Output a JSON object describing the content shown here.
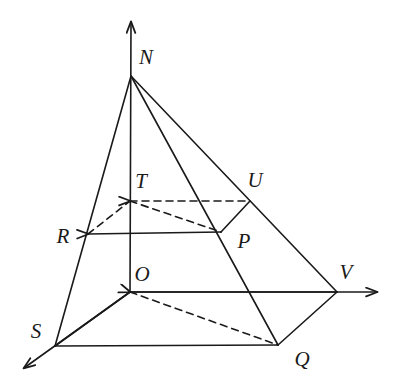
{
  "figure": {
    "type": "geometric-diagram",
    "width": 401,
    "height": 387,
    "stroke_color": "#1a1a1a",
    "background_color": "#ffffff",
    "stroke_width": 1.6,
    "dash_pattern": "7 5"
  },
  "points": {
    "N": {
      "label": "N",
      "x": 131,
      "y": 76,
      "label_x": 146,
      "label_y": 57
    },
    "T": {
      "label": "T",
      "x": 130,
      "y": 201,
      "label_x": 141,
      "label_y": 181
    },
    "U": {
      "label": "U",
      "x": 250,
      "y": 201,
      "label_x": 255,
      "label_y": 180
    },
    "R": {
      "label": "R",
      "x": 88,
      "y": 234,
      "label_x": 63,
      "label_y": 236
    },
    "P": {
      "label": "P",
      "x": 221,
      "y": 232,
      "label_x": 244,
      "label_y": 241
    },
    "O": {
      "label": "O",
      "x": 130,
      "y": 292,
      "label_x": 142,
      "label_y": 274
    },
    "V": {
      "label": "V",
      "x": 337,
      "y": 292,
      "label_x": 346,
      "label_y": 272
    },
    "S": {
      "label": "S",
      "x": 55,
      "y": 346,
      "label_x": 36,
      "label_y": 331
    },
    "Q": {
      "label": "Q",
      "x": 278,
      "y": 345,
      "label_x": 302,
      "label_y": 359
    }
  },
  "axes": [
    {
      "name": "z-axis-vertical",
      "from": [
        130,
        292
      ],
      "to": [
        131,
        22
      ],
      "arrow": true
    },
    {
      "name": "y-axis-right",
      "from": [
        130,
        292
      ],
      "to": [
        377,
        292
      ],
      "arrow": true
    },
    {
      "name": "x-axis-front-left",
      "from": [
        130,
        292
      ],
      "to": [
        24,
        368
      ],
      "arrow": true
    }
  ],
  "solid_edges": [
    {
      "name": "edge-N-S",
      "from": [
        131,
        76
      ],
      "to": [
        55,
        346
      ]
    },
    {
      "name": "edge-N-Q",
      "from": [
        131,
        76
      ],
      "to": [
        278,
        345
      ]
    },
    {
      "name": "edge-N-V",
      "from": [
        131,
        76
      ],
      "to": [
        337,
        292
      ]
    },
    {
      "name": "edge-R-P",
      "from": [
        88,
        234
      ],
      "to": [
        221,
        232
      ],
      "arrow_start": true
    },
    {
      "name": "edge-P-U",
      "from": [
        221,
        232
      ],
      "to": [
        250,
        201
      ]
    },
    {
      "name": "edge-S-Q",
      "from": [
        55,
        346
      ],
      "to": [
        278,
        345
      ]
    },
    {
      "name": "edge-Q-V",
      "from": [
        278,
        345
      ],
      "to": [
        337,
        292
      ]
    },
    {
      "name": "edge-O-V",
      "from": [
        130,
        292
      ],
      "to": [
        337,
        292
      ]
    },
    {
      "name": "edge-O-S",
      "from": [
        130,
        292
      ],
      "to": [
        55,
        346
      ]
    }
  ],
  "dashed_edges": [
    {
      "name": "edge-T-U",
      "from": [
        130,
        201
      ],
      "to": [
        250,
        201
      ],
      "arrow_start": true
    },
    {
      "name": "edge-R-T",
      "from": [
        88,
        234
      ],
      "to": [
        130,
        201
      ]
    },
    {
      "name": "edge-T-P",
      "from": [
        130,
        201
      ],
      "to": [
        221,
        232
      ]
    },
    {
      "name": "edge-O-Q",
      "from": [
        130,
        292
      ],
      "to": [
        278,
        345
      ],
      "arrow_start": true
    }
  ]
}
